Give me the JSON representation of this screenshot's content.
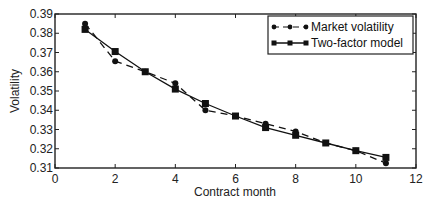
{
  "chart_data": {
    "type": "line",
    "title": "",
    "xlabel": "Contract month",
    "ylabel": "Volatility",
    "xlim": [
      0,
      12
    ],
    "ylim": [
      0.31,
      0.39
    ],
    "x_ticks": [
      0,
      2,
      4,
      6,
      8,
      10,
      12
    ],
    "y_ticks": [
      0.31,
      0.32,
      0.33,
      0.34,
      0.35,
      0.36,
      0.37,
      0.38,
      0.39
    ],
    "x_tick_labels": [
      "0",
      "2",
      "4",
      "6",
      "8",
      "10",
      "12"
    ],
    "y_tick_labels": [
      "0.31",
      "0.32",
      "0.33",
      "0.34",
      "0.35",
      "0.36",
      "0.37",
      "0.38",
      "0.39"
    ],
    "grid": false,
    "legend_position": "upper right",
    "x": [
      1,
      2,
      3,
      4,
      5,
      6,
      7,
      8,
      9,
      10,
      11
    ],
    "series": [
      {
        "name": "Market volatility",
        "line_style": "dashed",
        "marker": "circle",
        "values": [
          0.385,
          0.3655,
          0.36,
          0.354,
          0.34,
          0.337,
          0.333,
          0.329,
          0.323,
          0.319,
          0.3125
        ]
      },
      {
        "name": "Two-factor model",
        "line_style": "solid",
        "marker": "square",
        "values": [
          0.382,
          0.3705,
          0.36,
          0.351,
          0.3435,
          0.337,
          0.331,
          0.327,
          0.323,
          0.319,
          0.3155
        ]
      }
    ]
  },
  "colors": {
    "line": "#111111",
    "axis": "#222222",
    "background": "#ffffff"
  }
}
